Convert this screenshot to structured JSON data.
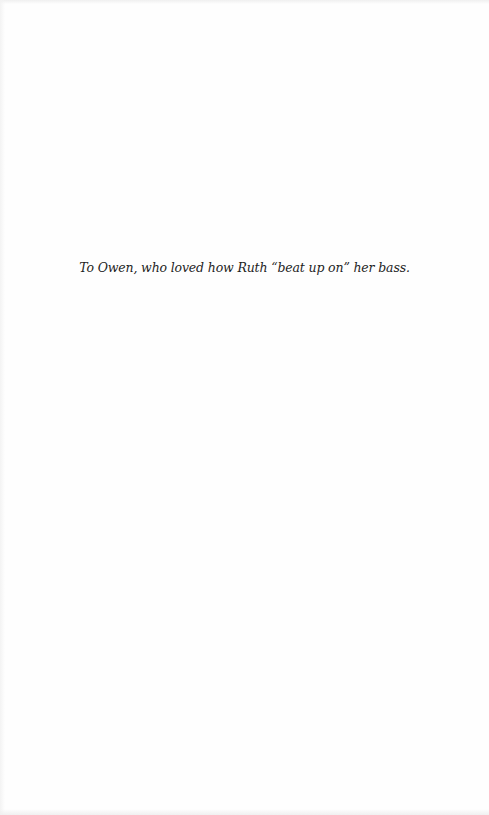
{
  "page": {
    "dedication": "To Owen, who loved how Ruth “beat up on” her bass."
  }
}
